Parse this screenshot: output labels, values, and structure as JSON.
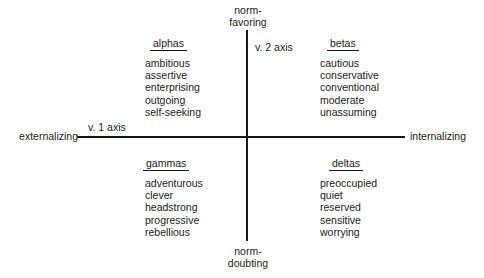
{
  "diagram": {
    "axes": {
      "horizontal": {
        "name": "v. 1 axis",
        "left_pole": "externalizing",
        "right_pole": "internalizing"
      },
      "vertical": {
        "name": "v. 2 axis",
        "top_pole": "norm-\nfavoring",
        "bottom_pole": "norm-\ndoubting"
      }
    },
    "quadrants": [
      {
        "id": "alphas",
        "heading": "alphas",
        "position": "top-left",
        "traits": [
          "ambitious",
          "assertive",
          "enterprising",
          "outgoing",
          "self-seeking"
        ]
      },
      {
        "id": "betas",
        "heading": "betas",
        "position": "top-right",
        "traits": [
          "cautious",
          "conservative",
          "conventional",
          "moderate",
          "unassuming"
        ]
      },
      {
        "id": "gammas",
        "heading": "gammas",
        "position": "bottom-left",
        "traits": [
          "adventurous",
          "clever",
          "headstrong",
          "progressive",
          "rebellious"
        ]
      },
      {
        "id": "deltas",
        "heading": "deltas",
        "position": "bottom-right",
        "traits": [
          "preoccupied",
          "quiet",
          "reserved",
          "sensitive",
          "worrying"
        ]
      }
    ],
    "colors": {
      "background": "#ffffff",
      "ink": "#1a1a1a",
      "axis": "#161616"
    }
  }
}
